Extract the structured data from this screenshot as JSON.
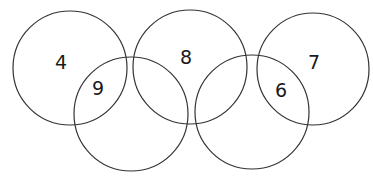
{
  "diagram": {
    "type": "five-overlapping-circles",
    "stroke_color": "#333333",
    "circles": [
      {
        "cx": 70,
        "cy": 68,
        "r": 57
      },
      {
        "cx": 131,
        "cy": 114,
        "r": 57
      },
      {
        "cx": 190,
        "cy": 67,
        "r": 57
      },
      {
        "cx": 252,
        "cy": 112,
        "r": 57
      },
      {
        "cx": 313,
        "cy": 69,
        "r": 56
      }
    ],
    "labels": [
      {
        "text": "4",
        "x": 61,
        "y": 62
      },
      {
        "text": "9",
        "x": 98,
        "y": 88
      },
      {
        "text": "8",
        "x": 186,
        "y": 57
      },
      {
        "text": "7",
        "x": 314,
        "y": 62
      },
      {
        "text": "6",
        "x": 281,
        "y": 90
      }
    ]
  }
}
